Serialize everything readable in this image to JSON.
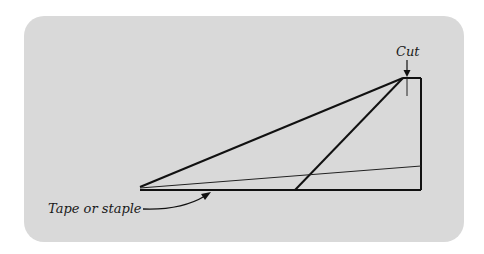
{
  "diagram": {
    "type": "paper-folding-instruction",
    "labels": {
      "cut": "Cut",
      "tape": "Tape or staple"
    },
    "colors": {
      "panel": "#d9d9d9",
      "line": "#111111",
      "background": "#ffffff"
    }
  }
}
